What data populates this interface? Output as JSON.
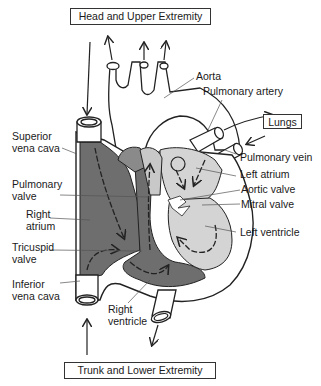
{
  "diagram": {
    "type": "heart-blood-flow",
    "boxes": {
      "top": "Head and Upper Extremity",
      "right": "Lungs",
      "bottom": "Trunk and Lower Extremity"
    },
    "labels": {
      "aorta": "Aorta",
      "pulmonary_artery": "Pulmonary artery",
      "superior_vena_cava": "Superior\nvena cava",
      "superior_vena_cava_l1": "Superior",
      "superior_vena_cava_l2": "vena cava",
      "pulmonary_vein": "Pulmonary vein",
      "pulmonary_valve_l1": "Pulmonary",
      "pulmonary_valve_l2": "valve",
      "left_atrium": "Left atrium",
      "aortic_valve": "Aortic valve",
      "mitral_valve": "Mitral valve",
      "right_atrium_l1": "Right",
      "right_atrium_l2": "atrium",
      "tricuspid_valve_l1": "Tricuspid",
      "tricuspid_valve_l2": "valve",
      "left_ventricle": "Left ventricle",
      "inferior_vena_cava_l1": "Inferior",
      "inferior_vena_cava_l2": "vena cava",
      "right_ventricle_l1": "Right",
      "right_ventricle_l2": "ventricle"
    },
    "colors": {
      "deoxygenated": "#6e6e6e",
      "oxygenated": "#d4d4d4",
      "outline": "#222222",
      "background": "#ffffff"
    }
  }
}
